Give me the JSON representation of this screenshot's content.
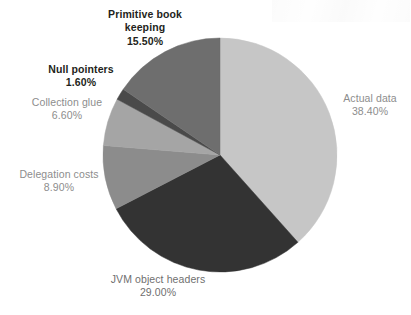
{
  "chart_data": {
    "type": "pie",
    "title": "",
    "subtitle": "",
    "xlabel": "",
    "ylabel": "",
    "legend_position": "callout-labels",
    "grid": false,
    "start_angle_deg": 0,
    "direction": "clockwise",
    "categories": [
      "Actual data",
      "JVM object headers",
      "Delegation costs",
      "Collection glue",
      "Null pointers",
      "Primitive book keeping"
    ],
    "values": [
      38.4,
      29.0,
      8.9,
      6.6,
      1.6,
      15.5
    ],
    "value_labels": [
      "38.40%",
      "29.00%",
      "8.90%",
      "6.60%",
      "1.60%",
      "15.50%"
    ],
    "colors": [
      "#c6c6c6",
      "#333333",
      "#8c8c8c",
      "#a5a5a5",
      "#4a4a4a",
      "#6e6e6e"
    ],
    "slices": [
      {
        "label": "Actual data",
        "value": 38.4,
        "value_label": "38.40%",
        "color": "#c6c6c6",
        "label_style": "muted"
      },
      {
        "label": "JVM object headers",
        "value": 29.0,
        "value_label": "29.00%",
        "color": "#333333",
        "label_style": "mid"
      },
      {
        "label": "Delegation costs",
        "value": 8.9,
        "value_label": "8.90%",
        "color": "#8c8c8c",
        "label_style": "muted"
      },
      {
        "label": "Collection glue",
        "value": 6.6,
        "value_label": "6.60%",
        "color": "#a5a5a5",
        "label_style": "muted"
      },
      {
        "label": "Null pointers",
        "value": 1.6,
        "value_label": "1.60%",
        "color": "#4a4a4a",
        "label_style": "strong"
      },
      {
        "label": "Primitive book keeping",
        "value": 15.5,
        "value_label": "15.50%",
        "color": "#6e6e6e",
        "label_style": "strong"
      }
    ]
  },
  "labels": {
    "primitive_book_keeping": {
      "line1": "Primitive book",
      "line2": "keeping",
      "pct": "15.50%"
    },
    "null_pointers": {
      "name": "Null pointers",
      "pct": "1.60%"
    },
    "collection_glue": {
      "name": "Collection glue",
      "pct": "6.60%"
    },
    "delegation_costs": {
      "name": "Delegation costs",
      "pct": "8.90%"
    },
    "jvm_object_headers": {
      "name": "JVM object headers",
      "pct": "29.00%"
    },
    "actual_data": {
      "name": "Actual data",
      "pct": "38.40%"
    }
  },
  "geometry": {
    "center_x": 220,
    "center_y": 155,
    "radius": 117
  }
}
